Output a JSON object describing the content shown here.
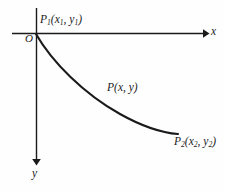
{
  "figure": {
    "type": "coordinate-diagram",
    "background_color": "#fefefe",
    "stroke_color": "#1a1a1a",
    "axes": {
      "x_axis": {
        "label": "x",
        "direction": "right",
        "arrowhead": "filled",
        "start_px": [
          12,
          33
        ],
        "end_px": [
          207,
          33
        ]
      },
      "y_axis": {
        "label": "y",
        "direction": "down",
        "arrowhead": "filled",
        "start_px": [
          36,
          8
        ],
        "end_px": [
          36,
          164
        ]
      },
      "origin_label": "O"
    },
    "points": [
      {
        "name": "point-p1",
        "label_base": "P",
        "label_sub": "1",
        "coord_x": "x",
        "coord_x_sub": "1",
        "coord_y": "y",
        "coord_y_sub": "1",
        "position_px": [
          36,
          34
        ]
      },
      {
        "name": "point-p",
        "label_base": "P",
        "label_sub": "",
        "coord_x": "x",
        "coord_x_sub": "",
        "coord_y": "y",
        "coord_y_sub": "",
        "position_px": [
          120,
          100
        ]
      },
      {
        "name": "point-p2",
        "label_base": "P",
        "label_sub": "2",
        "coord_x": "x",
        "coord_x_sub": "2",
        "coord_y": "y",
        "coord_y_sub": "2",
        "position_px": [
          178,
          134
        ]
      }
    ],
    "curve": {
      "name": "descending-curve",
      "path": "M 36 34 C 52 62, 84 94, 120 114 C 145 128, 165 133, 178 134",
      "stroke_width": 2.1
    },
    "labels": {
      "p1_text": "P",
      "p1_sub": "1",
      "p1_open": "(",
      "p1_x": "x",
      "p1_x_sub": "1",
      "p1_comma": ", ",
      "p1_y": "y",
      "p1_y_sub": "1",
      "p1_close": ")",
      "origin": "O",
      "p_text": "P",
      "p_open": "(",
      "p_x": "x",
      "p_comma": ", ",
      "p_y": "y",
      "p_close": ")",
      "p2_text": "P",
      "p2_sub": "2",
      "p2_open": "(",
      "p2_x": "x",
      "p2_x_sub": "2",
      "p2_comma": ", ",
      "p2_y": "y",
      "p2_y_sub": "2",
      "p2_close": ")",
      "x_axis": "x",
      "y_axis": "y"
    }
  }
}
